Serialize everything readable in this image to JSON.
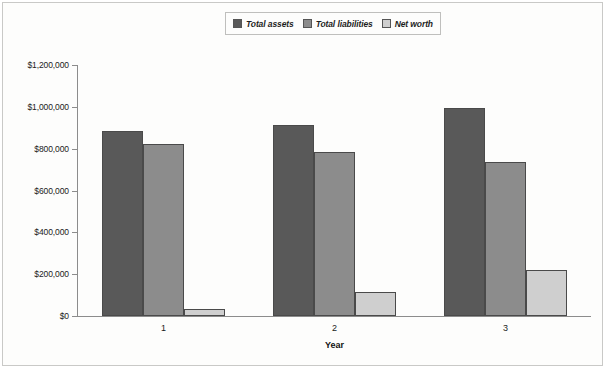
{
  "chart_data": {
    "type": "bar",
    "title": "",
    "xlabel": "Year",
    "ylabel": "",
    "categories": [
      "1",
      "2",
      "3"
    ],
    "ylim": [
      0,
      1200000
    ],
    "ytick_values": [
      0,
      200000,
      400000,
      600000,
      800000,
      1000000,
      1200000
    ],
    "ytick_labels": [
      "$0",
      "$200,000",
      "$400,000",
      "$600,000",
      "$800,000",
      "$1,000,000",
      "$1,200,000"
    ],
    "grid": false,
    "legend_position": "top-center",
    "series": [
      {
        "name": "Total assets",
        "color": "#595959",
        "values": [
          885000,
          915000,
          995000
        ]
      },
      {
        "name": "Total liabilities",
        "color": "#8c8c8c",
        "values": [
          820000,
          785000,
          735000
        ]
      },
      {
        "name": "Net worth",
        "color": "#cfcfcf",
        "values": [
          35000,
          115000,
          220000
        ]
      }
    ]
  }
}
